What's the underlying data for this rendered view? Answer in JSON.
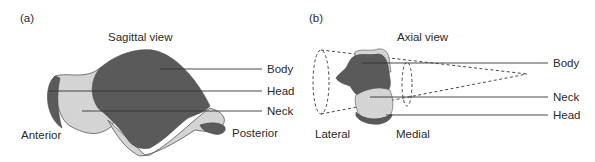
{
  "panel_a": {
    "tag": "(a)",
    "title": "Sagittal view",
    "labels": {
      "body": "Body",
      "head": "Head",
      "neck": "Neck"
    },
    "directions": {
      "left": "Anterior",
      "right": "Posterior"
    }
  },
  "panel_b": {
    "tag": "(b)",
    "title": "Axial view",
    "labels": {
      "body": "Body",
      "neck": "Neck",
      "head": "Head"
    },
    "directions": {
      "left": "Lateral",
      "right": "Medial"
    }
  },
  "colors": {
    "dark": "#5a5a5a",
    "light": "#d4d4d4",
    "line": "#333333"
  }
}
